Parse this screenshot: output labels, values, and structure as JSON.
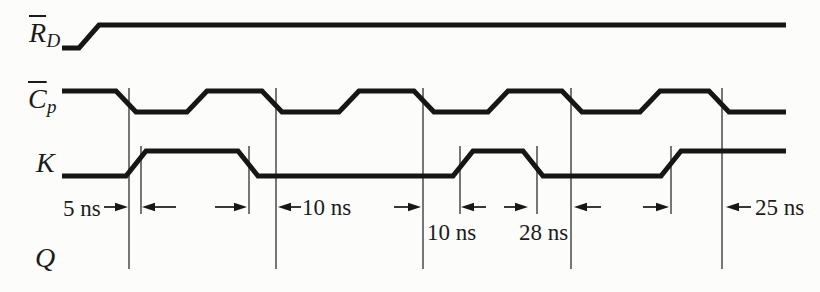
{
  "figure": {
    "width": 820,
    "height": 292,
    "background_color": "#fcfcfb",
    "ink_color": "#161616",
    "ref_line_color": "#2e2e2e"
  },
  "signals": [
    {
      "id": "rd",
      "label_main": "R",
      "label_sub": "D",
      "overbar": true,
      "initial": "low",
      "high_y": 25,
      "low_y": 48,
      "start_x": 62,
      "end_x": 786,
      "transitions": [
        89
      ]
    },
    {
      "id": "cp",
      "label_main": "C",
      "label_sub": "p",
      "overbar": true,
      "initial": "high",
      "high_y": 91,
      "low_y": 112,
      "start_x": 62,
      "end_x": 786,
      "transitions": [
        126,
        197,
        272,
        349,
        424,
        498,
        572,
        650,
        719
      ]
    },
    {
      "id": "k",
      "label_main": "K",
      "label_sub": "",
      "overbar": false,
      "initial": "low",
      "high_y": 151,
      "low_y": 176,
      "start_x": 62,
      "end_x": 786,
      "transitions": [
        136,
        248,
        463,
        533,
        671
      ]
    },
    {
      "id": "q",
      "label_main": "Q",
      "label_sub": "",
      "overbar": false,
      "initial": null,
      "transitions": []
    }
  ],
  "ref_lines": {
    "full": {
      "xs": [
        129,
        276,
        423,
        571,
        722
      ],
      "y1": 88,
      "y2": 269
    },
    "short": {
      "xs": [
        141,
        249,
        460,
        537,
        671
      ],
      "y1": 146,
      "y2": 214
    }
  },
  "dimension_arrows": {
    "y": 207,
    "arrows": [
      {
        "dir": "right",
        "from": 104,
        "tip": 128
      },
      {
        "dir": "left",
        "from": 176,
        "tip": 142
      },
      {
        "dir": "right",
        "from": 215,
        "tip": 247
      },
      {
        "dir": "left",
        "from": 301,
        "tip": 278
      },
      {
        "dir": "right",
        "from": 394,
        "tip": 421
      },
      {
        "dir": "left",
        "from": 486,
        "tip": 461
      },
      {
        "dir": "right",
        "from": 504,
        "tip": 528
      },
      {
        "dir": "left",
        "from": 601,
        "tip": 574
      },
      {
        "dir": "right",
        "from": 643,
        "tip": 669
      },
      {
        "dir": "left",
        "from": 751,
        "tip": 726
      }
    ]
  },
  "time_labels": [
    {
      "text": "5 ns",
      "x": 63,
      "y": 197
    },
    {
      "text": "10 ns",
      "x": 302,
      "y": 196
    },
    {
      "text": "10 ns",
      "x": 427,
      "y": 221
    },
    {
      "text": "28 ns",
      "x": 519,
      "y": 221
    },
    {
      "text": "25 ns",
      "x": 755,
      "y": 196
    }
  ]
}
